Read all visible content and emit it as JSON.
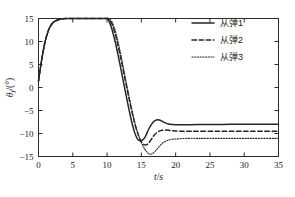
{
  "chart_data": {
    "type": "line",
    "title": "",
    "xlabel": "t/s",
    "ylabel": "θ_f/(°)",
    "xlim": [
      0,
      35
    ],
    "ylim": [
      -15,
      15
    ],
    "xticks": [
      0,
      5,
      10,
      15,
      20,
      25,
      30,
      35
    ],
    "yticks": [
      15,
      10,
      5,
      0,
      -5,
      -10,
      -15
    ],
    "grid": false,
    "legend_position": "top-right",
    "series": [
      {
        "name": "从弹3",
        "linestyle": "dotted",
        "color": "#262626",
        "x": [
          0,
          0.3,
          0.6,
          1,
          1.5,
          2,
          2.5,
          3,
          3.5,
          4,
          5,
          6,
          7,
          8,
          9,
          10,
          10.5,
          11,
          11.5,
          12,
          12.5,
          13,
          13.5,
          14,
          14.5,
          15,
          15.5,
          16,
          16.3,
          16.6,
          17,
          17.5,
          18,
          18.5,
          19,
          19.5,
          20,
          20.5,
          21,
          22,
          23,
          24,
          26,
          28,
          30,
          32,
          35
        ],
        "y": [
          1.4,
          4.5,
          7.2,
          10.2,
          12.6,
          13.9,
          14.5,
          14.8,
          14.95,
          15,
          15,
          15,
          15,
          15,
          15,
          15,
          14.7,
          13.3,
          10.6,
          7.2,
          3.4,
          -0.4,
          -4,
          -7.3,
          -10,
          -12,
          -13.4,
          -14.3,
          -14.5,
          -14.4,
          -13.9,
          -13,
          -12.2,
          -11.7,
          -11.4,
          -11.25,
          -11.2,
          -11.15,
          -11.1,
          -11.05,
          -11.05,
          -11.05,
          -11.05,
          -11.05,
          -11.05,
          -11.05,
          -11.05
        ]
      },
      {
        "name": "从弹2",
        "linestyle": "dashed",
        "color": "#262626",
        "x": [
          0,
          0.3,
          0.6,
          1,
          1.5,
          2,
          2.5,
          3,
          3.5,
          4,
          5,
          6,
          7,
          8,
          9,
          10,
          10.3,
          10.8,
          11.3,
          11.8,
          12.3,
          12.8,
          13.3,
          13.8,
          14.3,
          14.8,
          15.2,
          15.6,
          16,
          16.4,
          16.8,
          17.2,
          17.6,
          18,
          18.5,
          19,
          19.5,
          20,
          21,
          22,
          23,
          25,
          27,
          30,
          32,
          35
        ],
        "y": [
          1.4,
          4.5,
          7.2,
          10.2,
          12.6,
          13.9,
          14.5,
          14.8,
          14.95,
          15,
          15,
          15,
          15,
          15,
          15,
          15,
          14.8,
          13.5,
          11,
          7.8,
          4.2,
          0.5,
          -3.1,
          -6.4,
          -9.2,
          -11.2,
          -12.2,
          -12.5,
          -12.2,
          -11.4,
          -10.5,
          -9.9,
          -9.5,
          -9.3,
          -9.25,
          -9.3,
          -9.4,
          -9.45,
          -9.5,
          -9.5,
          -9.5,
          -9.5,
          -9.5,
          -9.5,
          -9.5,
          -9.5
        ]
      },
      {
        "name": "从弹1",
        "linestyle": "solid",
        "color": "#262626",
        "x": [
          0,
          0.3,
          0.6,
          1,
          1.5,
          2,
          2.5,
          3,
          3.5,
          4,
          5,
          6,
          7,
          8,
          9,
          10,
          10.2,
          10.6,
          11.1,
          11.6,
          12.1,
          12.6,
          13.1,
          13.6,
          14,
          14.4,
          14.8,
          15.2,
          15.6,
          16,
          16.4,
          16.8,
          17.2,
          17.6,
          18,
          18.5,
          19,
          19.5,
          20,
          21,
          22,
          24,
          26,
          28,
          31,
          33,
          35
        ],
        "y": [
          1.4,
          4.5,
          7.2,
          10.2,
          12.6,
          13.9,
          14.5,
          14.8,
          14.95,
          15,
          15,
          15,
          15,
          15,
          15,
          15,
          14.7,
          13.2,
          10.5,
          7.1,
          3.4,
          -0.4,
          -4.1,
          -7.5,
          -9.7,
          -11.1,
          -11.6,
          -11.4,
          -10.6,
          -9.3,
          -8.2,
          -7.4,
          -7.05,
          -7.05,
          -7.3,
          -7.7,
          -7.95,
          -8.05,
          -8.1,
          -8.1,
          -8.1,
          -8.05,
          -8.05,
          -8.0,
          -8.0,
          -8.0,
          -8.0
        ]
      }
    ],
    "legend": [
      {
        "label": "从弹1",
        "linestyle": "solid"
      },
      {
        "label": "从弹2",
        "linestyle": "dashed"
      },
      {
        "label": "从弹3",
        "linestyle": "dotted"
      }
    ]
  }
}
